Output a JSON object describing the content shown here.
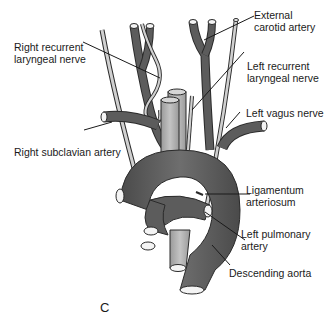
{
  "figure": {
    "panel_letter": "C",
    "labels": {
      "right_recurrent_laryngeal_nerve": [
        "Right recurrent",
        "laryngeal nerve"
      ],
      "right_subclavian_artery": [
        "Right subclavian artery"
      ],
      "external_carotid_artery": [
        "External",
        "carotid artery"
      ],
      "left_recurrent_laryngeal_nerve": [
        "Left recurrent",
        "laryngeal nerve"
      ],
      "left_vagus_nerve": [
        "Left vagus nerve"
      ],
      "ligamentum_arteriosum": [
        "Ligamentum",
        "arteriosum"
      ],
      "left_pulmonary_artery": [
        "Left pulmonary",
        "artery"
      ],
      "descending_aorta": [
        "Descending aorta"
      ]
    },
    "colors": {
      "artery_dark": "#5c5c5c",
      "artery_light": "#a9a9a9",
      "nerve": "#c8c8c8",
      "outline": "#2a2a2a",
      "lumen": "#f4f4f4"
    }
  }
}
